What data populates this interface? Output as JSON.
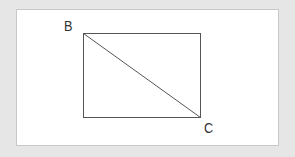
{
  "diagram": {
    "vertices": [
      {
        "label": "B",
        "x": 83,
        "y": 33
      },
      {
        "label": "C",
        "x": 200,
        "y": 117
      }
    ],
    "rectangle": {
      "x1": 83,
      "y1": 33,
      "x2": 200,
      "y2": 117
    },
    "diagonal": {
      "from": "B",
      "to": "C"
    },
    "colors": {
      "background": "#e6e6e6",
      "panel": "#ffffff",
      "stroke": "#555555"
    }
  }
}
